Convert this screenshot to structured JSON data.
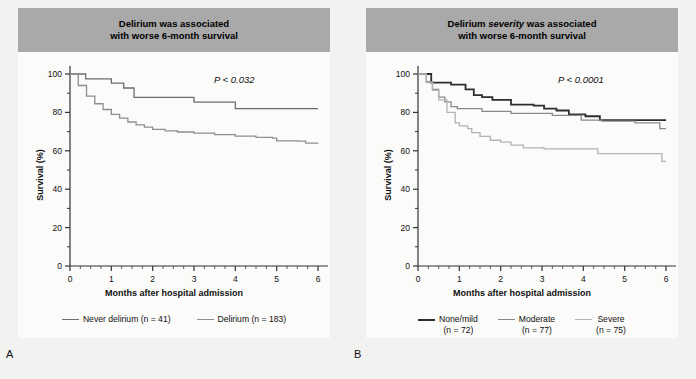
{
  "figure": {
    "background": "#f2f2f0",
    "banner_color": "#a9a9a9"
  },
  "panels": [
    {
      "key": "A",
      "panel_label": "A",
      "title_line1": "Delirium was associated",
      "title_line2": "with worse 6-month survival",
      "title_italic_word": "",
      "pvalue": "P < 0.032",
      "legend": [
        {
          "label": "Never delirium (n = 41)",
          "sub": "",
          "color": "#6e6e6e"
        },
        {
          "label": "Delirium (n = 183)",
          "sub": "",
          "color": "#8f8f8f"
        }
      ],
      "chart_data": {
        "type": "line",
        "title": "Delirium was associated with worse 6-month survival",
        "xlabel": "Months after hospital admission",
        "ylabel": "Survival (%)",
        "xlim": [
          0,
          6
        ],
        "ylim": [
          0,
          100
        ],
        "xticks": [
          0,
          1,
          2,
          3,
          4,
          5,
          6
        ],
        "yticks": [
          0,
          20,
          40,
          60,
          80,
          100
        ],
        "grid": false,
        "annotation": "P < 0.032",
        "legend_position": "below",
        "series": [
          {
            "name": "Never delirium (n = 41)",
            "color": "#6e6e6e",
            "step": "post",
            "x": [
              0.0,
              0.35,
              0.38,
              0.95,
              1.0,
              1.12,
              1.3,
              1.35,
              1.55,
              1.6,
              2.95,
              3.0,
              3.95,
              4.0,
              6.0
            ],
            "y": [
              100,
              100,
              97.5,
              97.5,
              95.2,
              95.2,
              92.7,
              92.7,
              87.8,
              87.8,
              87.8,
              85.4,
              85.4,
              82.0,
              82.0
            ]
          },
          {
            "name": "Delirium (n = 183)",
            "color": "#8f8f8f",
            "step": "post",
            "x": [
              0.0,
              0.2,
              0.4,
              0.6,
              0.8,
              1.0,
              1.2,
              1.4,
              1.6,
              1.8,
              2.0,
              2.3,
              2.6,
              3.0,
              3.5,
              4.0,
              4.5,
              4.9,
              5.0,
              5.5,
              5.7,
              6.0
            ],
            "y": [
              100,
              94.0,
              88.5,
              84.5,
              81.5,
              79.0,
              77.0,
              75.0,
              73.5,
              72.3,
              71.2,
              70.4,
              69.8,
              69.2,
              68.4,
              67.6,
              67.0,
              66.6,
              65.2,
              65.0,
              64.0,
              63.8
            ]
          }
        ]
      }
    },
    {
      "key": "B",
      "panel_label": "B",
      "title_line1_pre": "Delirium ",
      "title_italic_word": "severity",
      "title_line1_post": " was associated",
      "title_line2": "with worse 6-month survival",
      "pvalue": "P < 0.0001",
      "legend": [
        {
          "label": "None/mild",
          "sub": "(n = 72)",
          "color": "#2e2e2e"
        },
        {
          "label": "Moderate",
          "sub": "(n = 77)",
          "color": "#8a8a8a"
        },
        {
          "label": "Severe",
          "sub": "(n = 75)",
          "color": "#b3b3b3"
        }
      ],
      "chart_data": {
        "type": "line",
        "title": "Delirium severity was associated with worse 6-month survival",
        "xlabel": "Months after hospital admission",
        "ylabel": "Survival (%)",
        "xlim": [
          0,
          6
        ],
        "ylim": [
          0,
          100
        ],
        "xticks": [
          0,
          1,
          2,
          3,
          4,
          5,
          6
        ],
        "yticks": [
          0,
          20,
          40,
          60,
          80,
          100
        ],
        "grid": false,
        "annotation": "P < 0.0001",
        "legend_position": "below",
        "series": [
          {
            "name": "None/mild (n = 72)",
            "color": "#2e2e2e",
            "step": "post",
            "x": [
              0.0,
              0.28,
              0.32,
              0.75,
              0.8,
              1.1,
              1.15,
              1.3,
              1.35,
              1.5,
              1.55,
              1.75,
              1.8,
              2.2,
              2.25,
              2.75,
              2.8,
              3.0,
              3.05,
              3.3,
              3.35,
              3.6,
              3.65,
              4.0,
              4.05,
              4.35,
              4.4,
              6.0
            ],
            "y": [
              100,
              100,
              95.5,
              95.5,
              94.5,
              94.5,
              92.0,
              92.0,
              89.0,
              89.0,
              88.0,
              88.0,
              86.5,
              86.5,
              84.0,
              84.0,
              83.5,
              83.5,
              82.0,
              82.0,
              81.0,
              81.0,
              79.0,
              79.0,
              78.0,
              78.0,
              76.0,
              76.0
            ]
          },
          {
            "name": "Moderate (n = 77)",
            "color": "#8a8a8a",
            "step": "post",
            "x": [
              0.0,
              0.2,
              0.35,
              0.5,
              0.65,
              0.8,
              0.95,
              1.0,
              1.5,
              1.55,
              2.2,
              2.25,
              3.2,
              3.25,
              3.9,
              3.95,
              4.4,
              4.45,
              5.2,
              5.25,
              5.8,
              5.85,
              6.0
            ],
            "y": [
              100,
              96.0,
              92.0,
              88.0,
              85.5,
              83.0,
              82.0,
              82.0,
              82.0,
              80.5,
              80.5,
              79.5,
              79.5,
              78.5,
              78.5,
              76.0,
              76.0,
              75.5,
              75.5,
              74.5,
              74.5,
              71.5,
              71.5
            ]
          },
          {
            "name": "Severe (n = 75)",
            "color": "#b3b3b3",
            "step": "post",
            "x": [
              0.0,
              0.2,
              0.35,
              0.5,
              0.7,
              0.9,
              1.0,
              1.2,
              1.3,
              1.45,
              1.5,
              1.7,
              1.75,
              1.95,
              2.0,
              2.2,
              2.25,
              2.5,
              2.55,
              3.0,
              3.05,
              4.3,
              4.35,
              5.6,
              5.65,
              5.85,
              5.9,
              6.0
            ],
            "y": [
              100,
              95.5,
              91.5,
              86.5,
              80.0,
              74.5,
              73.0,
              71.5,
              69.5,
              69.5,
              67.5,
              67.5,
              65.5,
              65.5,
              64.5,
              64.5,
              63.0,
              63.0,
              61.5,
              61.5,
              61.0,
              61.0,
              58.5,
              58.5,
              58.5,
              58.5,
              54.5,
              54.5
            ]
          }
        ]
      }
    }
  ]
}
